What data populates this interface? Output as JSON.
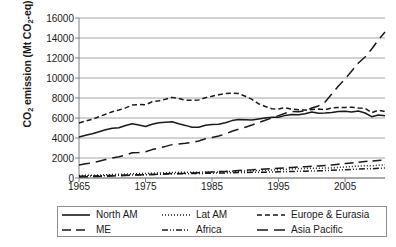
{
  "chart_data": {
    "type": "line",
    "title": "",
    "xlabel": "",
    "ylabel": "CO2 emission (Mt CO2-eq)",
    "ylabel_parts": {
      "pre": "CO",
      "sub1": "2",
      "mid": " emission (Mt CO",
      "sub2": "2",
      "post": "-eq)"
    },
    "xlim": [
      1965,
      2011
    ],
    "ylim": [
      0,
      16000
    ],
    "yticks": [
      0,
      2000,
      4000,
      6000,
      8000,
      10000,
      12000,
      14000,
      16000
    ],
    "xticks": [
      1965,
      1975,
      1985,
      1995,
      2005
    ],
    "grid": "horizontal",
    "legend_position": "bottom-outside",
    "x": [
      1965,
      1966,
      1967,
      1968,
      1969,
      1970,
      1971,
      1972,
      1973,
      1974,
      1975,
      1976,
      1977,
      1978,
      1979,
      1980,
      1981,
      1982,
      1983,
      1984,
      1985,
      1986,
      1987,
      1988,
      1989,
      1990,
      1991,
      1992,
      1993,
      1994,
      1995,
      1996,
      1997,
      1998,
      1999,
      2000,
      2001,
      2002,
      2003,
      2004,
      2005,
      2006,
      2007,
      2008,
      2009,
      2010,
      2011
    ],
    "series": [
      {
        "name": "North AM",
        "dash": "solid",
        "values": [
          4100,
          4280,
          4420,
          4620,
          4820,
          4980,
          5020,
          5250,
          5430,
          5290,
          5150,
          5380,
          5530,
          5570,
          5620,
          5420,
          5260,
          5080,
          5080,
          5280,
          5340,
          5380,
          5530,
          5740,
          5840,
          5820,
          5790,
          5900,
          6000,
          6080,
          6080,
          6260,
          6350,
          6330,
          6420,
          6590,
          6480,
          6500,
          6560,
          6660,
          6680,
          6610,
          6700,
          6500,
          6130,
          6290,
          6220
        ]
      },
      {
        "name": "Lat AM",
        "dash": "dotted",
        "values": [
          250,
          265,
          280,
          300,
          320,
          345,
          365,
          390,
          420,
          440,
          450,
          480,
          500,
          525,
          555,
          570,
          580,
          575,
          560,
          575,
          590,
          615,
          640,
          660,
          680,
          700,
          725,
          750,
          770,
          800,
          830,
          870,
          910,
          940,
          950,
          985,
          980,
          990,
          1010,
          1060,
          1100,
          1140,
          1190,
          1230,
          1210,
          1280,
          1320
        ]
      },
      {
        "name": "Europe & Eurasia",
        "dash": "dashed",
        "values": [
          5500,
          5700,
          5880,
          6120,
          6380,
          6620,
          6800,
          7010,
          7290,
          7340,
          7330,
          7620,
          7720,
          7880,
          8060,
          7950,
          7790,
          7770,
          7810,
          8030,
          8180,
          8320,
          8440,
          8480,
          8440,
          8180,
          7860,
          7420,
          7150,
          6920,
          6900,
          7030,
          6880,
          6830,
          6790,
          6850,
          6890,
          6830,
          7000,
          7060,
          7060,
          7080,
          7000,
          6980,
          6530,
          6780,
          6640
        ]
      },
      {
        "name": "ME",
        "dash": "longdash",
        "values": [
          110,
          125,
          140,
          160,
          180,
          200,
          225,
          250,
          280,
          300,
          320,
          360,
          390,
          420,
          450,
          460,
          470,
          500,
          530,
          570,
          600,
          640,
          660,
          700,
          740,
          790,
          820,
          870,
          900,
          940,
          980,
          1020,
          1060,
          1100,
          1130,
          1170,
          1200,
          1250,
          1300,
          1380,
          1440,
          1500,
          1570,
          1650,
          1700,
          1760,
          1810
        ]
      },
      {
        "name": "Africa",
        "dash": "dashdot",
        "values": [
          180,
          195,
          205,
          220,
          235,
          255,
          270,
          290,
          310,
          320,
          330,
          350,
          370,
          390,
          410,
          420,
          430,
          440,
          450,
          465,
          480,
          500,
          510,
          530,
          545,
          560,
          570,
          580,
          585,
          600,
          615,
          635,
          655,
          670,
          680,
          700,
          715,
          740,
          770,
          800,
          830,
          860,
          890,
          920,
          930,
          970,
          1000
        ]
      },
      {
        "name": "Asia Pacific",
        "dash": "mediumdash",
        "values": [
          1300,
          1420,
          1520,
          1680,
          1840,
          2000,
          2120,
          2300,
          2520,
          2540,
          2620,
          2840,
          3000,
          3160,
          3340,
          3400,
          3470,
          3560,
          3700,
          3920,
          4060,
          4200,
          4400,
          4680,
          4880,
          5080,
          5300,
          5540,
          5780,
          6000,
          6240,
          6480,
          6660,
          6620,
          6720,
          7000,
          7200,
          7600,
          8400,
          9200,
          9900,
          10700,
          11500,
          12100,
          12900,
          13800,
          14600
        ]
      }
    ]
  },
  "axis": {
    "ytick_labels": [
      "16000",
      "14000",
      "12000",
      "10000",
      "8000",
      "6000",
      "4000",
      "2000",
      "0"
    ],
    "xtick_labels": [
      "1965",
      "1975",
      "1985",
      "1995",
      "2005"
    ]
  },
  "legend": {
    "items": [
      {
        "label": "North AM",
        "style": "solid"
      },
      {
        "label": "Lat AM",
        "style": "dotted"
      },
      {
        "label": "Europe & Eurasia",
        "style": "dashed"
      },
      {
        "label": "ME",
        "style": "longdash"
      },
      {
        "label": "Africa",
        "style": "dashdot"
      },
      {
        "label": "Asia Pacific",
        "style": "mediumdash"
      }
    ]
  },
  "colors": {
    "line": "#1a1a1a",
    "grid": "#a6a6a6",
    "axis": "#808080",
    "text": "#1a1a1a",
    "legend_border": "#8c8c8c",
    "background": "#ffffff"
  }
}
